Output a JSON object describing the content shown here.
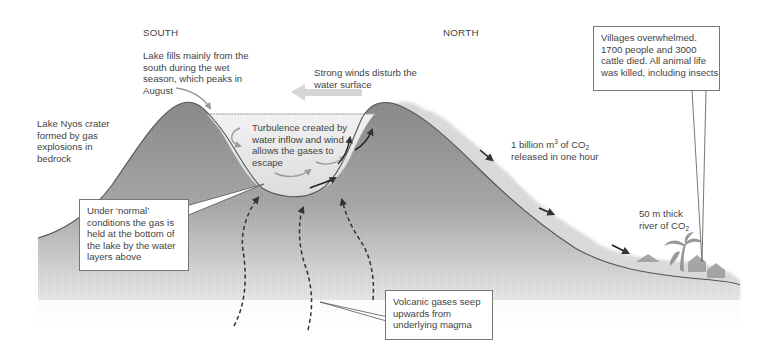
{
  "diagram": {
    "orientation": {
      "left": "SOUTH",
      "right": "NORTH"
    },
    "labels": {
      "crater": [
        "Lake Nyos crater",
        "formed by gas",
        "explosions in",
        "bedrock"
      ],
      "lake_fills": [
        "Lake fills mainly from the",
        "south during the wet",
        "season, which peaks in",
        "August"
      ],
      "winds": [
        "Strong winds disturb the",
        "water surface"
      ],
      "turbulence": [
        "Turbulence created by",
        "water inflow and wind",
        "allows the gases to",
        "escape"
      ],
      "co2_release_line1_pre": "1 billion m",
      "co2_release_line1_sup": "3",
      "co2_release_line1_mid": " of CO",
      "co2_release_line1_sub": "2",
      "co2_release_line2": "released in one hour",
      "river_line1": "50 m thick",
      "river_line2_pre": "river of CO",
      "river_line2_sub": "2"
    },
    "callouts": {
      "normal_conditions": [
        "Under ‘normal’",
        "conditions the gas is",
        "held at the bottom of",
        "the lake by the water",
        "layers above"
      ],
      "volcanic_gases": [
        "Volcanic gases seep",
        "upwards from",
        "underlying magma"
      ],
      "villages": [
        "Villages overwhelmed.",
        "1700 people and 3000",
        "cattle died. All animal life",
        "was killed, including insects"
      ]
    },
    "icons": {
      "wind_arrow": "arrow-left-icon",
      "inflow_arrow": "curved-arrow-icon",
      "gas_flow_arrows": "dashed-arrow-up-icon",
      "co2_flow_arrows": "arrow-down-right-icon",
      "village": "house-icon",
      "trees": "palm-tree-icon"
    },
    "colors": {
      "rock_dark": "#8a8a8a",
      "rock_light": "#e8e8e8",
      "lake": "#ececec",
      "co2_cloud": "#d6d6d6",
      "outline": "#444444",
      "arrows": "#333333",
      "wind_arrow": "#d8d8d8"
    }
  }
}
